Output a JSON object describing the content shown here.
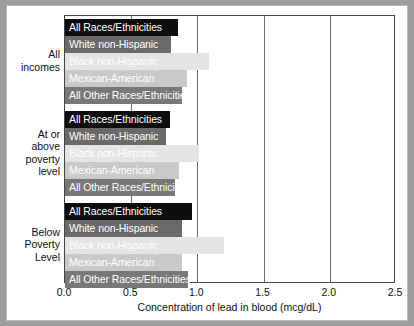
{
  "chart_data": {
    "type": "bar",
    "orientation": "horizontal",
    "title": "",
    "xlabel": "Concentration of lead in blood (mcg/dL)",
    "ylabel": "",
    "xlim": [
      0.0,
      2.5
    ],
    "xticks": [
      "0.0",
      "0.5",
      "1.0",
      "1.5",
      "2.0",
      "2.5"
    ],
    "xtick_values": [
      0.0,
      0.5,
      1.0,
      1.5,
      2.0,
      2.5
    ],
    "grid": true,
    "grid_axis": "x",
    "legend": "none",
    "categories": [
      "All Races/Ethnicities",
      "White non-Hispanic",
      "Black non-Hispanic",
      "Mexican-American",
      "All Other Races/Ethnicities"
    ],
    "groups": [
      {
        "name": "All incomes",
        "caption_lines": [
          "All",
          "incomes"
        ],
        "bars": [
          {
            "label": "All Races/Ethnicities",
            "value": 0.85,
            "color": "#0d0d0d",
            "text_color": "#ffffff"
          },
          {
            "label": "White non-Hispanic",
            "value": 0.8,
            "color": "#6a6a6a",
            "text_color": "#ffffff"
          },
          {
            "label": "Black non-Hispanic",
            "value": 1.09,
            "color": "#e4e4e4",
            "text_color": "#ffffff"
          },
          {
            "label": "Mexican-American",
            "value": 0.92,
            "color": "#c9c9c9",
            "text_color": "#ffffff"
          },
          {
            "label": "All Other Races/Ethnicities",
            "value": 0.88,
            "color": "#787878",
            "text_color": "#ffffff"
          }
        ]
      },
      {
        "name": "At or above poverty level",
        "caption_lines": [
          "At or",
          "above",
          "poverty",
          "level"
        ],
        "bars": [
          {
            "label": "All Races/Ethnicities",
            "value": 0.79,
            "color": "#0d0d0d",
            "text_color": "#ffffff"
          },
          {
            "label": "White non-Hispanic",
            "value": 0.76,
            "color": "#6a6a6a",
            "text_color": "#ffffff"
          },
          {
            "label": "Black non-Hispanic",
            "value": 1.01,
            "color": "#e4e4e4",
            "text_color": "#ffffff"
          },
          {
            "label": "Mexican-American",
            "value": 0.86,
            "color": "#c9c9c9",
            "text_color": "#ffffff"
          },
          {
            "label": "All Other Races/Ethnicities",
            "value": 0.83,
            "color": "#787878",
            "text_color": "#ffffff"
          }
        ]
      },
      {
        "name": "Below Poverty Level",
        "caption_lines": [
          "Below",
          "Poverty",
          "Level"
        ],
        "bars": [
          {
            "label": "All Races/Ethnicities",
            "value": 0.96,
            "color": "#0d0d0d",
            "text_color": "#ffffff"
          },
          {
            "label": "White non-Hispanic",
            "value": 0.88,
            "color": "#6a6a6a",
            "text_color": "#ffffff"
          },
          {
            "label": "Black non-Hispanic",
            "value": 1.2,
            "color": "#e4e4e4",
            "text_color": "#ffffff"
          },
          {
            "label": "Mexican-American",
            "value": 0.88,
            "color": "#c9c9c9",
            "text_color": "#ffffff"
          },
          {
            "label": "All Other Races/Ethnicities",
            "value": 0.93,
            "color": "#787878",
            "text_color": "#ffffff"
          }
        ]
      }
    ]
  },
  "style": {
    "frame_color": "#9d9d9d",
    "panel_color": "#ffffff",
    "axis_color": "#444444",
    "grid_color": "#6d6d6d",
    "text_color": "#111111"
  }
}
